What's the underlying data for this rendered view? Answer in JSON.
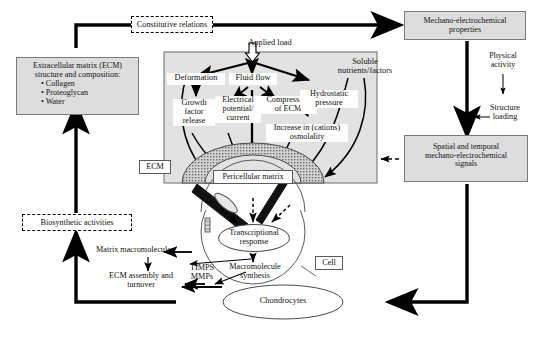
{
  "diagram": {
    "colors": {
      "panel_fill": "#e2e2e2",
      "box_fill": "#dddddd",
      "box_border": "#7a7a7a",
      "matrix_fill": "#bdbdbd",
      "line": "#000000"
    }
  },
  "nodes": {
    "constitutive_relations": "Constitutive relations",
    "mechano_props": "Mechano-electrochemical\nproperties",
    "mechano_props_l1": "Mechano-electrochemical",
    "mechano_props_l2": "properties",
    "ecm_composition_l1": "Extracellular matrix (ECM)",
    "ecm_composition_l2": "structure and composition:",
    "ecm_bullet_1": "• Collagen",
    "ecm_bullet_2": "• Proteoglycan",
    "ecm_bullet_3": "• Water",
    "applied_load": "Applied load",
    "deformation": "Deformation",
    "fluid_flow": "Fluid flow",
    "soluble_l1": "Soluble",
    "soluble_l2": "nutrients/factors",
    "growth_factor_l1": "Growth",
    "growth_factor_l2": "factor",
    "growth_factor_l3": "release",
    "electrical_l1": "Electrical",
    "electrical_l2": "potential/",
    "electrical_l3": "current",
    "compression_l1": "Compression",
    "compression_l2": "of ECM",
    "hydrostatic_l1": "Hydrostatic",
    "hydrostatic_l2": "pressure",
    "osmolality_l1": "Increase in (cations)",
    "osmolality_l2": "osmolality",
    "ecm_tag": "ECM",
    "pericellular_matrix": "Pericellular matrix",
    "transcriptional_l1": "Transcriptional",
    "transcriptional_l2": "response",
    "cell": "Cell",
    "macromolecule_l1": "Macromolecule",
    "macromolecule_l2": "synthesis",
    "timps_l1": "TIMPS",
    "timps_l2": "MMPs",
    "matrix_macromolecules": "Matrix macromolecules",
    "ecm_assembly_l1": "ECM assembly and",
    "ecm_assembly_l2": "turnover",
    "biosynthetic_activities": "Biosynthetic activities",
    "chondrocytes": "Chondrocytes",
    "physical_activity_l1": "Physical",
    "physical_activity_l2": "activity",
    "structure_loading_l1": "Structure",
    "structure_loading_l2": "loading",
    "spatial_l1": "Spatial and temporal",
    "spatial_l2": "mechano-electrochemical",
    "spatial_l3": "signals"
  }
}
